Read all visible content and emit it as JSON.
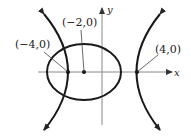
{
  "diagram": {
    "axes": {
      "x_label": "x",
      "y_label": "y"
    },
    "points": [
      {
        "label": "(−4,0)",
        "desc": "ellipse-hyperbola intersection / left vertex"
      },
      {
        "label": "(−2,0)",
        "desc": "ellipse center"
      },
      {
        "label": "(4,0)",
        "desc": "right hyperbola vertex"
      }
    ],
    "shapes": [
      "ellipse",
      "hyperbola"
    ],
    "colors": {
      "stroke": "#1a1a1a",
      "axis": "#888888"
    }
  }
}
